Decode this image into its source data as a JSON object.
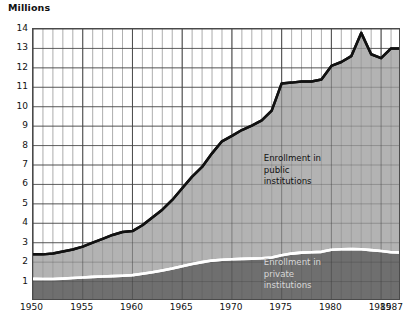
{
  "chart_data": {
    "type": "area",
    "title": "",
    "subtitle": "",
    "xlabel": "",
    "ylabel": "Millions",
    "units_label": "Millions",
    "stacked": true,
    "grid": true,
    "legend_position": "inside-plot",
    "xlim": [
      1950,
      1987
    ],
    "ylim": [
      0,
      14
    ],
    "ytick_labels": [
      "14",
      "13",
      "12",
      "11",
      "10",
      "9",
      "8",
      "7",
      "6",
      "5",
      "4",
      "3",
      "2",
      "1"
    ],
    "ytick_values": [
      14,
      13,
      12,
      11,
      10,
      9,
      8,
      7,
      6,
      5,
      4,
      3,
      2,
      1
    ],
    "xtick_labels": [
      "1950",
      "1955",
      "1960",
      "1965",
      "1970",
      "1975",
      "1980",
      "1985",
      "1987"
    ],
    "xtick_values": [
      1950,
      1955,
      1960,
      1965,
      1970,
      1975,
      1980,
      1985,
      1987
    ],
    "minor_xgrid_interval": 1,
    "colors": {
      "public_fill": "#b3b3b3",
      "private_fill": "#6f6f6f",
      "total_line": "#111111",
      "divider_line": "#ffffff",
      "grid_major": "#4a4a4a",
      "grid_minor": "#9a9a9a",
      "plot_background": "#ffffff"
    },
    "x": [
      1950,
      1951,
      1952,
      1953,
      1954,
      1955,
      1956,
      1957,
      1958,
      1959,
      1960,
      1961,
      1962,
      1963,
      1964,
      1965,
      1966,
      1967,
      1968,
      1969,
      1970,
      1971,
      1972,
      1973,
      1974,
      1975,
      1976,
      1977,
      1978,
      1979,
      1980,
      1981,
      1982,
      1983,
      1984,
      1985,
      1986,
      1987
    ],
    "series": [
      {
        "name": "Enrollment in private institutions",
        "label": "Enrollment in\nprivate\ninstitutions",
        "color": "#6f6f6f",
        "values": [
          1.14,
          1.13,
          1.13,
          1.15,
          1.18,
          1.21,
          1.24,
          1.26,
          1.28,
          1.3,
          1.33,
          1.4,
          1.48,
          1.57,
          1.67,
          1.79,
          1.9,
          2.0,
          2.08,
          2.12,
          2.15,
          2.17,
          2.18,
          2.2,
          2.24,
          2.35,
          2.44,
          2.49,
          2.51,
          2.53,
          2.64,
          2.66,
          2.68,
          2.66,
          2.62,
          2.57,
          2.51,
          2.5
        ]
      },
      {
        "name": "Enrollment in public institutions",
        "label": "Enrollment in\npublic\ninstitutions",
        "color": "#b3b3b3",
        "values": [
          1.26,
          1.27,
          1.32,
          1.4,
          1.47,
          1.59,
          1.76,
          1.94,
          2.12,
          2.25,
          2.27,
          2.5,
          2.82,
          3.13,
          3.53,
          4.01,
          4.5,
          4.9,
          5.52,
          6.1,
          6.35,
          6.63,
          6.85,
          7.1,
          7.56,
          8.85,
          8.8,
          8.81,
          8.79,
          8.87,
          9.46,
          9.64,
          9.92,
          11.14,
          10.08,
          9.93,
          10.49,
          10.5
        ]
      }
    ],
    "total": {
      "name": "Total enrollment",
      "color": "#111111",
      "values": [
        2.4,
        2.4,
        2.45,
        2.55,
        2.65,
        2.8,
        3.0,
        3.2,
        3.4,
        3.55,
        3.6,
        3.9,
        4.3,
        4.7,
        5.2,
        5.8,
        6.4,
        6.9,
        7.6,
        8.22,
        8.5,
        8.8,
        9.03,
        9.3,
        9.8,
        11.2,
        11.24,
        11.3,
        11.3,
        11.4,
        12.1,
        12.3,
        12.6,
        13.8,
        12.7,
        12.5,
        13.0,
        13.0
      ]
    },
    "annotations": [
      {
        "id": "public-label",
        "text": "Enrollment in\npublic\ninstitutions",
        "x": 1973.2,
        "y": 7.3,
        "color": "#111111"
      },
      {
        "id": "private-label",
        "text": "Enrollment in\nprivate\ninstitutions",
        "x": 1973.2,
        "y": 1.95,
        "color": "#d8d8d8"
      }
    ]
  }
}
